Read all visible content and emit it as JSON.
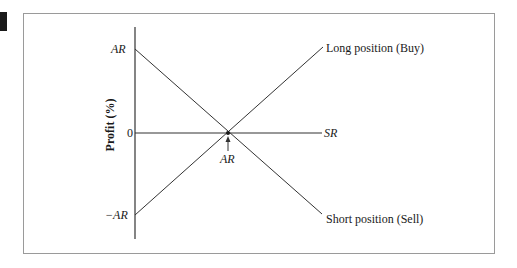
{
  "diagram": {
    "y_axis_label": "Profit (%)",
    "x_axis_label": "SR",
    "y_ticks": [
      {
        "label": "AR",
        "italic": true
      },
      {
        "label": "0",
        "italic": false
      },
      {
        "label": "−AR",
        "italic": true
      }
    ],
    "intersection_label": "AR",
    "lines": [
      {
        "name": "long",
        "label": "Long position (Buy)",
        "from": "-AR",
        "to": "upper-right"
      },
      {
        "name": "short",
        "label": "Short position (Sell)",
        "from": "AR",
        "to": "lower-right"
      }
    ],
    "colors": {
      "line": "#333333",
      "frame": "#9a9a9a",
      "text": "#1a1a1a"
    }
  }
}
